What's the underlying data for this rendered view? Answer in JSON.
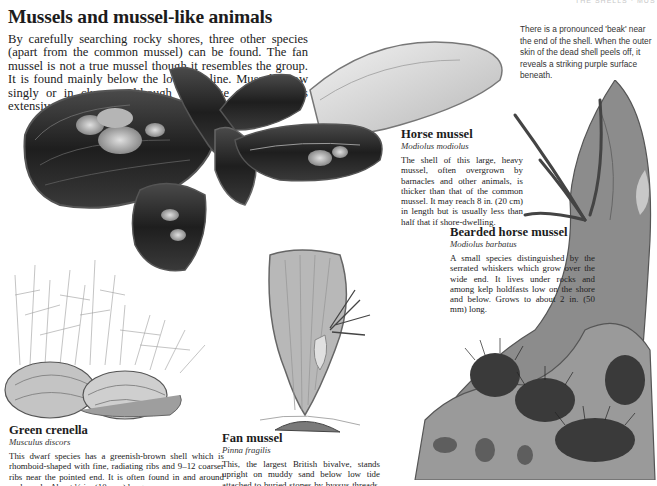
{
  "running_head": "THE SHELLS · MUSSELS",
  "page": {
    "title": "Mussels and mussel-like animals",
    "intro": "By carefully searching rocky shores, three other species (apart from the common mussel) can be found. The fan mussel is not a true mussel though it resembles the group. It is found mainly below the low-tide line. Mussels grow singly or in clumps, although the horse mussel forms extensive offshore beds."
  },
  "note": {
    "text": "There is a pronounced 'beak' near the end of the shell. When the outer skin of the dead shell peels off, it reveals a striking purple surface beneath."
  },
  "entries": [
    {
      "id": "horse-mussel",
      "name": "Horse mussel",
      "latin": "Modiolus modiolus",
      "text": "The shell of this large, heavy mussel, often overgrown by barnacles and other animals, is thicker than that of the common mussel. It may reach 8 in. (20 cm) in length but is usually less than half that if shore-dwelling."
    },
    {
      "id": "bearded-horse-mussel",
      "name": "Bearded horse mussel",
      "latin": "Modiolus barbatus",
      "text": "A small species distinguished by the serrated whiskers which grow over the wide end. It lives under rocks and among kelp holdfasts low on the shore and below. Grows to about 2 in. (50 mm) long."
    },
    {
      "id": "green-crenella",
      "name": "Green crenella",
      "latin": "Musculus discors",
      "text": "This dwarf species has a greenish-brown shell which is rhomboid-shaped with fine, radiating ribs and 9–12 coarser ribs near the pointed end. It is often found in and around rock pools. About ½ in. (10 mm) long."
    },
    {
      "id": "fan-mussel",
      "name": "Fan mussel",
      "latin": "Pinna fragilis",
      "text": "This, the largest British bivalve, stands upright on muddy sand below low tide attached to buried stones by byssus threads. About 12 in. (30 cm) high."
    }
  ],
  "illustrations": [
    {
      "name": "horse-mussel-clump",
      "tone": "#2a2a2a"
    },
    {
      "name": "green-crenella-seaweed",
      "tone": "#8a8a8a"
    },
    {
      "name": "fan-mussel-shell",
      "tone": "#9a9a9a"
    },
    {
      "name": "kelp-holdfast-bearded-mussels",
      "tone": "#7a7a7a"
    }
  ]
}
